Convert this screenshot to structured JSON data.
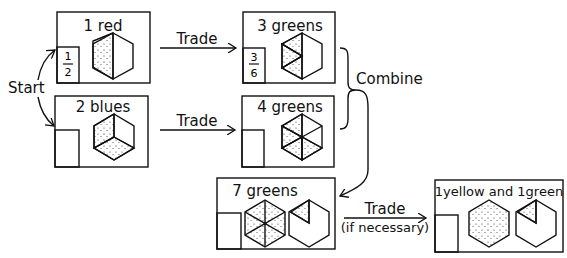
{
  "diagram": {
    "start_label": "Start",
    "boxes": [
      {
        "id": "box-1-red",
        "title": "1 red",
        "fraction": {
          "numerator": "1",
          "denominator": "2"
        },
        "shaded_sixths": 3
      },
      {
        "id": "box-2-blues",
        "title": "2 blues",
        "fraction": null,
        "shaded_sixths": 4
      },
      {
        "id": "box-3-greens",
        "title": "3 greens",
        "fraction": {
          "numerator": "3",
          "denominator": "6"
        },
        "shaded_sixths": 3
      },
      {
        "id": "box-4-greens",
        "title": "4 greens",
        "fraction": null,
        "shaded_sixths": 4
      },
      {
        "id": "box-7-greens",
        "title": "7 greens",
        "fraction": null,
        "shaded_sixths": 7
      },
      {
        "id": "box-1yellow-1green",
        "title": "1yellow and 1green",
        "fraction": null,
        "shaded_sixths": 7
      }
    ],
    "arrows": {
      "trade_top": "Trade",
      "trade_bottom": "Trade",
      "combine": "Combine",
      "trade_final": "Trade",
      "trade_final_note": "(if necessary)"
    }
  }
}
